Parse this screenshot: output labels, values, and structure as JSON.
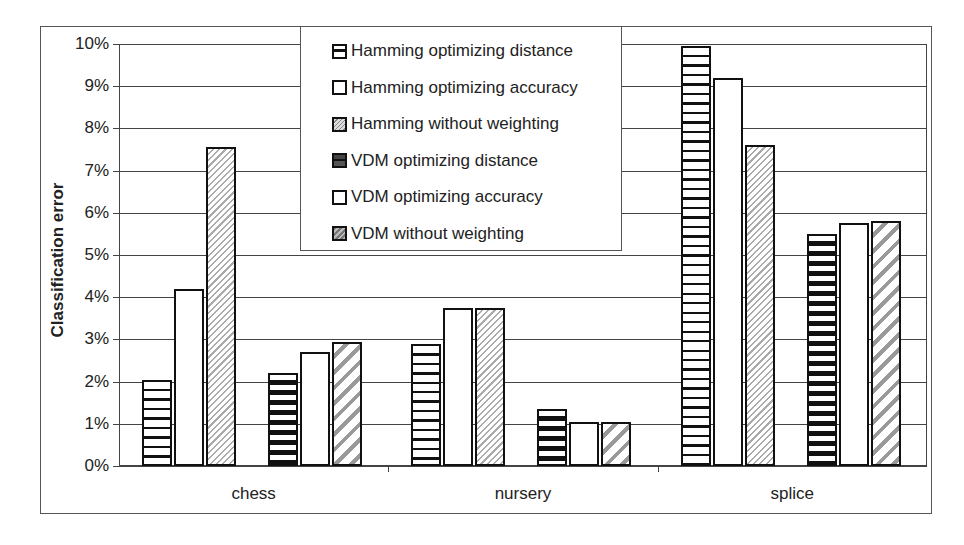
{
  "chart_data": {
    "type": "bar",
    "title": "",
    "xlabel": "",
    "ylabel": "Classification error",
    "ylim": [
      0,
      10
    ],
    "y_unit": "%",
    "yticks": [
      "0%",
      "1%",
      "2%",
      "3%",
      "4%",
      "5%",
      "6%",
      "7%",
      "8%",
      "9%",
      "10%"
    ],
    "grid": true,
    "legend_position": "top-center (inside plot)",
    "categories": [
      "chess",
      "nursery",
      "splice"
    ],
    "series": [
      {
        "name": "Hamming optimizing distance",
        "pattern": "horizontal-stripes",
        "values": [
          2.05,
          2.9,
          9.95
        ]
      },
      {
        "name": "Hamming optimizing accuracy",
        "pattern": "plain-white",
        "values": [
          4.2,
          3.75,
          9.2
        ]
      },
      {
        "name": "Hamming without weighting",
        "pattern": "fine-diagonal-light",
        "values": [
          7.55,
          3.75,
          7.6
        ]
      },
      {
        "name": "VDM optimizing distance",
        "pattern": "bold-horizontal-stripes",
        "values": [
          2.2,
          1.35,
          5.5
        ]
      },
      {
        "name": "VDM optimizing accuracy",
        "pattern": "plain-white",
        "values": [
          2.7,
          1.05,
          5.75
        ]
      },
      {
        "name": "VDM without weighting",
        "pattern": "bold-diagonal-gray",
        "values": [
          2.95,
          1.05,
          5.8
        ]
      }
    ]
  },
  "colors": {
    "bar_border": "#111111",
    "gridline": "#444444",
    "background": "#ffffff"
  }
}
